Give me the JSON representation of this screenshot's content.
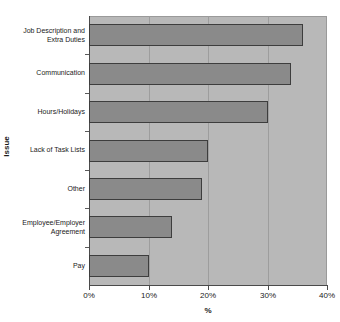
{
  "chart_data": {
    "type": "bar",
    "orientation": "horizontal",
    "title": "",
    "clipped_title": "",
    "xlabel": "%",
    "ylabel": "Issue",
    "xlim": [
      0,
      40
    ],
    "xticks": [
      "0%",
      "10%",
      "20%",
      "30%",
      "40%"
    ],
    "xtick_values": [
      0,
      10,
      20,
      30,
      40
    ],
    "grid": true,
    "legend": false,
    "categories": [
      "Job Description and\nExtra Duties",
      "Communication",
      "Hours/Holidays",
      "Lack of Task Lists",
      "Other",
      "Employee/Employer\nAgreement",
      "Pay"
    ],
    "values": [
      36,
      34,
      30,
      20,
      19,
      14,
      10
    ],
    "bar_color": "#8a8a8a",
    "bar_edge_color": "#3d3d3d",
    "plot_background": "#b8b8b8",
    "figure_background": "#ffffff",
    "gridline_color": "#9d9d9d",
    "axis_color": "#4a4a4a"
  }
}
